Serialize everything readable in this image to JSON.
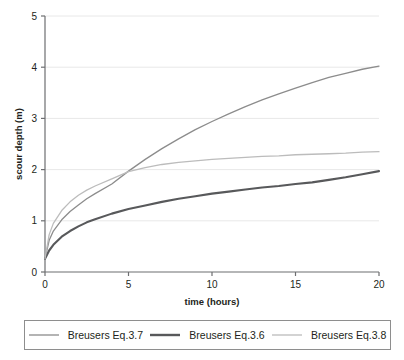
{
  "chart_data": {
    "type": "line",
    "title": "",
    "xlabel": "time (hours)",
    "ylabel": "scour depth (m)",
    "xlim": [
      0,
      20
    ],
    "ylim": [
      0,
      5
    ],
    "xticks": [
      "0",
      "5",
      "10",
      "15",
      "20"
    ],
    "yticks": [
      "0",
      "1",
      "2",
      "3",
      "4",
      "5"
    ],
    "grid": "horizontal",
    "legend_position": "bottom",
    "x": [
      0,
      0.25,
      0.5,
      1,
      1.5,
      2,
      2.5,
      3,
      4,
      5,
      6,
      7,
      8,
      9,
      10,
      11,
      12,
      13,
      14,
      15,
      16,
      17,
      18,
      19,
      20
    ],
    "series": [
      {
        "name": "Breusers Eq.3.7",
        "color": "#8c8c8c",
        "width": 1.3,
        "values": [
          0.26,
          0.62,
          0.8,
          1.02,
          1.18,
          1.31,
          1.43,
          1.53,
          1.72,
          1.97,
          2.2,
          2.41,
          2.6,
          2.78,
          2.94,
          3.09,
          3.23,
          3.36,
          3.48,
          3.59,
          3.7,
          3.8,
          3.88,
          3.96,
          4.02
        ]
      },
      {
        "name": "Breusers Eq.3.6",
        "color": "#58595b",
        "width": 2.1,
        "values": [
          0.26,
          0.42,
          0.53,
          0.69,
          0.8,
          0.89,
          0.97,
          1.03,
          1.14,
          1.23,
          1.3,
          1.37,
          1.43,
          1.48,
          1.53,
          1.57,
          1.61,
          1.65,
          1.68,
          1.72,
          1.75,
          1.8,
          1.85,
          1.91,
          1.97
        ]
      },
      {
        "name": "Breusers Eq.3.8",
        "color": "#bcbcbc",
        "width": 1.3,
        "values": [
          0.26,
          0.73,
          0.95,
          1.2,
          1.37,
          1.5,
          1.6,
          1.68,
          1.82,
          1.96,
          2.04,
          2.1,
          2.14,
          2.17,
          2.2,
          2.22,
          2.24,
          2.26,
          2.27,
          2.29,
          2.3,
          2.31,
          2.32,
          2.34,
          2.35
        ]
      }
    ]
  },
  "legend": {
    "entries": [
      {
        "label": "Breusers Eq.3.7"
      },
      {
        "label": "Breusers Eq.3.6"
      },
      {
        "label": "Breusers Eq.3.8"
      }
    ]
  }
}
